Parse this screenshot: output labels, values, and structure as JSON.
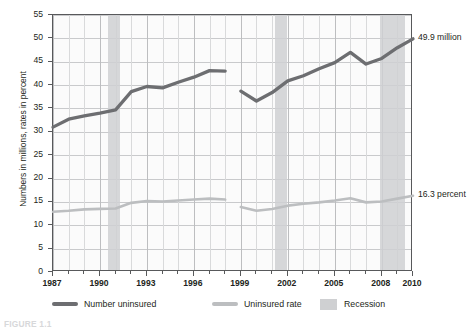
{
  "chart_data": {
    "type": "line",
    "title": "",
    "xlabel": "",
    "ylabel": "Numbers in millions, rates in percent",
    "xlim": [
      1987,
      2010
    ],
    "ylim": [
      0,
      55
    ],
    "ytick_step": 5,
    "yticks": [
      "0",
      "5",
      "10",
      "15",
      "20",
      "25",
      "30",
      "35",
      "40",
      "45",
      "50",
      "55"
    ],
    "xticks": [
      "1987",
      "1990",
      "1993",
      "1996",
      "1999",
      "2002",
      "2005",
      "2008",
      "2010"
    ],
    "grid": true,
    "legend_position": "bottom",
    "x": [
      1987,
      1988,
      1989,
      1990,
      1991,
      1992,
      1993,
      1994,
      1995,
      1996,
      1997,
      1998,
      1999,
      2000,
      2001,
      2002,
      2003,
      2004,
      2005,
      2006,
      2007,
      2008,
      2009,
      2010
    ],
    "series": [
      {
        "name": "Number uninsured",
        "units": "millions",
        "color": "#6d6e71",
        "values": [
          31.0,
          32.7,
          33.4,
          34.0,
          34.7,
          38.6,
          39.7,
          39.4,
          40.6,
          41.7,
          43.1,
          43.0,
          38.7,
          36.6,
          38.4,
          40.9,
          42.0,
          43.5,
          44.8,
          47.0,
          44.5,
          45.7,
          48.0,
          49.9
        ],
        "break_after_index": 11,
        "end_label": "49.9 million"
      },
      {
        "name": "Uninsured rate",
        "units": "percent",
        "color": "#bcbec0",
        "values": [
          12.9,
          13.1,
          13.4,
          13.5,
          13.6,
          14.8,
          15.2,
          15.1,
          15.3,
          15.5,
          15.7,
          15.5,
          13.9,
          13.1,
          13.5,
          14.2,
          14.6,
          14.9,
          15.3,
          15.8,
          14.9,
          15.1,
          15.7,
          16.3
        ],
        "break_after_index": 11,
        "end_label": "16.3 percent"
      }
    ],
    "shaded_regions": [
      {
        "label": "Recession",
        "start": 1990.5,
        "end": 1991.25
      },
      {
        "label": "Recession",
        "start": 2001.2,
        "end": 2001.95
      },
      {
        "label": "Recession",
        "start": 2007.9,
        "end": 2009.5
      }
    ],
    "annotations": [
      {
        "name": "number-uninsured-end-label",
        "text": "49.9 million"
      },
      {
        "name": "uninsured-rate-end-label",
        "text": "16.3 percent"
      }
    ]
  },
  "legend": {
    "items": [
      {
        "label": "Number uninsured",
        "type": "line",
        "color": "#6d6e71"
      },
      {
        "label": "Uninsured rate",
        "type": "line",
        "color": "#bcbec0"
      },
      {
        "label": "Recession",
        "type": "box",
        "color": "#cfd0d2"
      }
    ]
  },
  "caption": {
    "text": "FIGURE 1.1"
  }
}
